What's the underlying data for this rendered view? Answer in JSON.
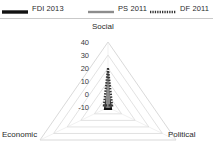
{
  "legend": {
    "items": [
      {
        "label": "FDI 2013",
        "style": "solid-thick-black",
        "color": "#111111"
      },
      {
        "label": "PS 2011",
        "style": "solid-gray",
        "color": "#8c8c8c"
      },
      {
        "label": "DF 2011",
        "style": "dotted-dark",
        "color": "#333333"
      }
    ]
  },
  "chart_data": {
    "type": "radar",
    "title": "",
    "categories": [
      "Social",
      "Economic",
      "Political"
    ],
    "axis_labels": {
      "top": "Social",
      "bottom_left": "Economic",
      "bottom_right": "Political"
    },
    "tick_labels": [
      "40",
      "30",
      "20",
      "10",
      "0",
      "-10"
    ],
    "tick_values": [
      40,
      30,
      20,
      10,
      0,
      -10
    ],
    "rlim": [
      -10,
      40
    ],
    "grid": true,
    "grid_color": "#d5d5d5",
    "legend_position": "top",
    "series": [
      {
        "name": "FDI 2013",
        "color": "#111111",
        "style": "solid",
        "width": 2.6,
        "values": {
          "Social": 2,
          "Economic": -8,
          "Political": -8
        }
      },
      {
        "name": "PS 2011",
        "color": "#8c8c8c",
        "style": "solid",
        "width": 2.2,
        "values": {
          "Social": 17,
          "Economic": -11,
          "Political": -11
        }
      },
      {
        "name": "DF 2011",
        "color": "#333333",
        "style": "dotted",
        "width": 2.2,
        "values": {
          "Social": 20,
          "Economic": -13,
          "Political": -13
        }
      }
    ]
  }
}
